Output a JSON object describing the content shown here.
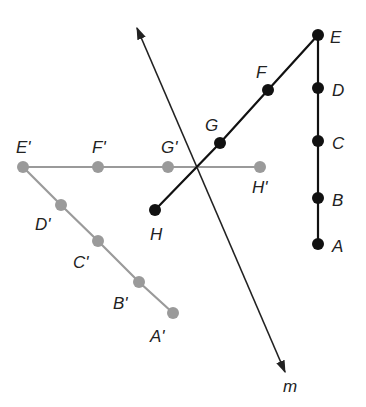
{
  "diagram": {
    "type": "reflection",
    "colors": {
      "original": "#111111",
      "image": "#9a9a9a",
      "line": "#222222",
      "background": "#ffffff"
    },
    "line_m": {
      "label": "m",
      "x1": 137,
      "y1": 28,
      "x2": 285,
      "y2": 372
    },
    "original": {
      "points": [
        {
          "label": "A",
          "x": 318,
          "y": 244
        },
        {
          "label": "B",
          "x": 318,
          "y": 198
        },
        {
          "label": "C",
          "x": 318,
          "y": 141
        },
        {
          "label": "D",
          "x": 318,
          "y": 88
        },
        {
          "label": "E",
          "x": 318,
          "y": 35
        },
        {
          "label": "F",
          "x": 268,
          "y": 90
        },
        {
          "label": "G",
          "x": 220,
          "y": 143
        },
        {
          "label": "H",
          "x": 155,
          "y": 210
        }
      ]
    },
    "image": {
      "points": [
        {
          "label": "A'",
          "x": 173,
          "y": 313
        },
        {
          "label": "B'",
          "x": 139,
          "y": 282
        },
        {
          "label": "C'",
          "x": 98,
          "y": 241
        },
        {
          "label": "D'",
          "x": 61,
          "y": 205
        },
        {
          "label": "E'",
          "x": 23,
          "y": 167
        },
        {
          "label": "F'",
          "x": 98,
          "y": 167
        },
        {
          "label": "G'",
          "x": 168,
          "y": 167
        },
        {
          "label": "H'",
          "x": 260,
          "y": 167
        }
      ]
    },
    "labels": {
      "A": "A",
      "B": "B",
      "C": "C",
      "D": "D",
      "E": "E",
      "F": "F",
      "G": "G",
      "H": "H",
      "A_prime": "A'",
      "B_prime": "B'",
      "C_prime": "C'",
      "D_prime": "D'",
      "E_prime": "E'",
      "F_prime": "F'",
      "G_prime": "G'",
      "H_prime": "H'",
      "m": "m"
    }
  }
}
